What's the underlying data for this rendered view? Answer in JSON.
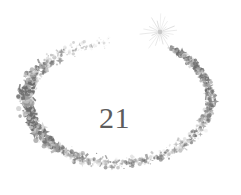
{
  "artwork": {
    "title": "21",
    "subject": "confetti-sparkle-swirl",
    "center_label": "21",
    "description": "A swirling open ring of scattered confetti specks ending in a radiating sparkle burst, with the numeral 21 at its center.",
    "canvas": {
      "width": 241,
      "height": 195
    },
    "colors": {
      "background": "#ffffff",
      "numeral": "#5c5c5c",
      "speck_dark": "#6b6b6b",
      "speck_mid": "#9a9a9a",
      "speck_light": "#c9c9c9",
      "speck_faint": "#e2e2e2",
      "sparkle": "#b0b0b0"
    },
    "elements": {
      "sparkle_label": "sparkle-burst",
      "trail_label": "confetti-trail",
      "numeral_label": "21"
    },
    "sparkle": {
      "cx": 160,
      "cy": 32,
      "ray_count": 22,
      "inner_radius": 3,
      "outer_radius": 17
    },
    "swirl": {
      "cx": 118,
      "cy": 100,
      "rx": 92,
      "ry": 63,
      "start_angle_deg": -55,
      "sweep_deg": 320,
      "speck_count": 1500
    }
  }
}
